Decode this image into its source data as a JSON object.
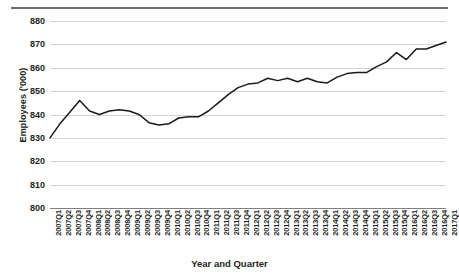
{
  "chart_data": {
    "type": "line",
    "title": "",
    "xlabel": "Year and Quarter",
    "ylabel": "Employees ('000)",
    "ylim": [
      800,
      880
    ],
    "ytick_labels": [
      "880",
      "870",
      "860",
      "850",
      "840",
      "830",
      "820",
      "810",
      "800"
    ],
    "ytick_values": [
      880,
      870,
      860,
      850,
      840,
      830,
      820,
      810,
      800
    ],
    "grid": true,
    "legend": "none",
    "line_color": "#1a1a1a",
    "categories": [
      "2007Q1",
      "2007Q2",
      "2007Q3",
      "2007Q4",
      "2008Q1",
      "2008Q2",
      "2008Q3",
      "2008Q4",
      "2009Q1",
      "2009Q2",
      "2009Q3",
      "2009Q4",
      "2010Q1",
      "2010Q2",
      "2010Q3",
      "2010Q4",
      "2011Q1",
      "2011Q2",
      "2011Q3",
      "2011Q4",
      "2012Q1",
      "2012Q2",
      "2012Q3",
      "2012Q4",
      "2013Q1",
      "2013Q2",
      "2013Q3",
      "2013Q4",
      "2014Q1",
      "2014Q2",
      "2014Q3",
      "2014Q4",
      "2015Q1",
      "2015Q2",
      "2015Q3",
      "2015Q4",
      "2016Q1",
      "2016Q2",
      "2016Q3",
      "2016Q4",
      "2017Q1"
    ],
    "values": [
      830.0,
      836.0,
      841.0,
      846.0,
      841.5,
      840.0,
      841.5,
      842.0,
      841.5,
      840.0,
      836.5,
      835.5,
      836.0,
      838.5,
      839.0,
      839.0,
      841.5,
      845.0,
      848.5,
      851.5,
      853.0,
      853.5,
      855.5,
      854.5,
      855.5,
      854.0,
      855.5,
      854.0,
      853.5,
      856.0,
      857.5,
      858.0,
      858.0,
      860.5,
      862.5,
      866.5,
      863.5,
      868.0,
      868.0,
      869.5,
      871.0
    ]
  }
}
